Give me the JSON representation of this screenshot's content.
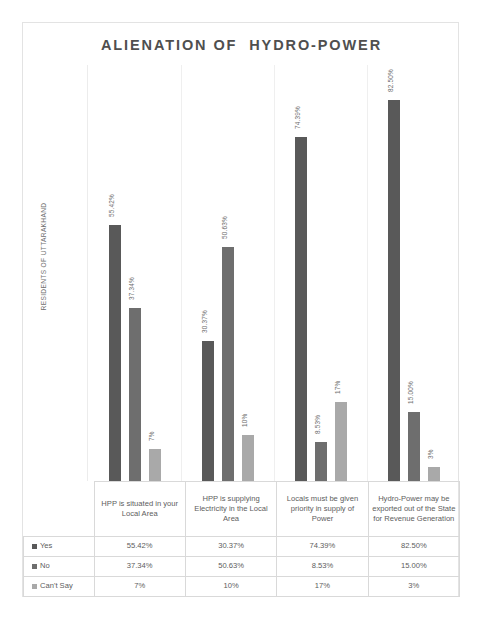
{
  "chart_data": {
    "type": "bar",
    "title": "ALIENATION OF  HYDRO-POWER",
    "xlabel": "",
    "ylabel": "RESIDENTS OF UTTARAKHAND",
    "ylim": [
      0,
      90
    ],
    "grid": false,
    "legend_position": "table-left-column",
    "categories": [
      "HPP is situated in your Local Area",
      "HPP is supplying Electricity in the Local Area",
      "Locals must be given priority in supply of Power",
      "Hydro-Power may be exported out of the State for Revenue Generation"
    ],
    "series": [
      {
        "name": "Yes",
        "color": "#595959",
        "values": [
          55.42,
          30.37,
          74.39,
          82.5
        ],
        "labels": [
          "55.42%",
          "30.37%",
          "74.39%",
          "82.50%"
        ]
      },
      {
        "name": "No",
        "color": "#6e6e6e",
        "values": [
          37.34,
          50.63,
          8.53,
          15.0
        ],
        "labels": [
          "37.34%",
          "50.63%",
          "8.53%",
          "15.00%"
        ]
      },
      {
        "name": "Can't Say",
        "color": "#a9a9a9",
        "values": [
          7,
          10,
          17,
          3
        ],
        "labels": [
          "7%",
          "10%",
          "17%",
          "3%"
        ]
      }
    ]
  },
  "table": {
    "headers": [
      "HPP is situated in your Local Area",
      "HPP is supplying Electricity in the Local Area",
      "Locals must be given priority in supply of Power",
      "Hydro-Power may be exported out of the State for Revenue Generation"
    ],
    "rows": [
      {
        "label": "Yes",
        "values": [
          "55.42%",
          "30.37%",
          "74.39%",
          "82.50%"
        ]
      },
      {
        "label": "No",
        "values": [
          "37.34%",
          "50.63%",
          "8.53%",
          "15.00%"
        ]
      },
      {
        "label": "Can't Say",
        "values": [
          "7%",
          "10%",
          "17%",
          "3%"
        ]
      }
    ]
  },
  "colors": {
    "series_yes": "#595959",
    "series_no": "#6e6e6e",
    "series_cant_say": "#a9a9a9",
    "frame": "#e3e3e3",
    "grid": "#efefef",
    "text": "#5d5d5d"
  }
}
